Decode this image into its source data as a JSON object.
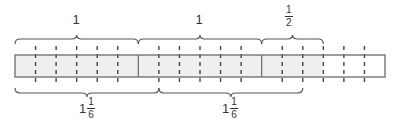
{
  "diagram": {
    "colors": {
      "stroke": "#6b6b6b",
      "shaded_fill": "#efefef",
      "unshaded_fill": "#ffffff",
      "text": "#333333"
    },
    "bar": {
      "total_wholes": 3,
      "parts_per_whole": 6,
      "shaded_parts": 15,
      "x_start": 15,
      "x_end": 385,
      "y_top": 55,
      "y_bottom": 77
    },
    "top_labels": [
      {
        "type": "whole",
        "text": "1"
      },
      {
        "type": "whole",
        "text": "1"
      },
      {
        "type": "fraction",
        "numerator": "1",
        "denominator": "2"
      }
    ],
    "bottom_labels": [
      {
        "type": "mixed",
        "whole": "1",
        "numerator": "1",
        "denominator": "6"
      },
      {
        "type": "mixed",
        "whole": "1",
        "numerator": "1",
        "denominator": "6"
      }
    ]
  }
}
